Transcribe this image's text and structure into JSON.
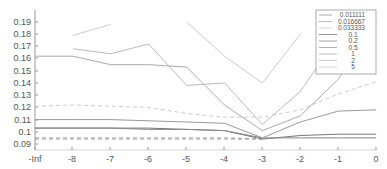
{
  "chart_data": {
    "type": "line",
    "title": "",
    "xlabel": "",
    "ylabel": "",
    "x_ticks": [
      "-Inf",
      "-8",
      "-7",
      "-6",
      "-5",
      "-4",
      "-3",
      "-2",
      "-1",
      "0"
    ],
    "x": [
      -9,
      -8,
      -7,
      -6,
      -5,
      -4,
      -3,
      -2,
      -1,
      0
    ],
    "y_ticks": [
      "0.09",
      "0.1",
      "0.11",
      "0.12",
      "0.13",
      "0.14",
      "0.15",
      "0.16",
      "0.17",
      "0.18",
      "0.19"
    ],
    "ylim": [
      0.088,
      0.199
    ],
    "xlim": [
      -9,
      0
    ],
    "grid": false,
    "legend_position": "upper right",
    "legend_title": "",
    "series": [
      {
        "name": "0.011111",
        "style": "dashed",
        "color": "#999999",
        "values": [
          0.095,
          0.095,
          0.095,
          0.095,
          0.095,
          0.095,
          0.094,
          null,
          null,
          null
        ]
      },
      {
        "name": "0.016667",
        "style": "dashed",
        "color": "#aaaaaa",
        "values": [
          0.094,
          0.094,
          0.094,
          0.094,
          0.094,
          0.094,
          0.094,
          null,
          null,
          null
        ]
      },
      {
        "name": "0.033333",
        "style": "dashed",
        "color": "#cccccc",
        "values": [
          0.121,
          0.122,
          0.121,
          0.12,
          0.115,
          0.112,
          0.112,
          0.118,
          0.131,
          0.141
        ]
      },
      {
        "name": "0.1",
        "style": "solid",
        "color": "#777777",
        "values": [
          0.103,
          0.103,
          0.103,
          0.103,
          0.102,
          0.101,
          0.094,
          0.097,
          0.098,
          0.098
        ]
      },
      {
        "name": "0.2",
        "style": "solid",
        "color": "#888888",
        "values": [
          0.103,
          0.103,
          0.103,
          0.102,
          0.102,
          0.101,
          0.095,
          0.095,
          0.095,
          0.095
        ]
      },
      {
        "name": "0.5",
        "style": "solid",
        "color": "#999999",
        "values": [
          0.11,
          0.11,
          0.11,
          0.109,
          0.108,
          0.107,
          0.095,
          0.108,
          0.117,
          0.118
        ]
      },
      {
        "name": "1",
        "style": "solid",
        "color": "#aaaaaa",
        "values": [
          0.162,
          0.162,
          0.155,
          0.155,
          0.153,
          0.122,
          0.101,
          0.113,
          0.143,
          0.19
        ]
      },
      {
        "name": "2",
        "style": "solid",
        "color": "#bbbbbb",
        "values": [
          null,
          0.168,
          0.164,
          0.172,
          0.138,
          0.14,
          0.106,
          0.133,
          0.178,
          null
        ]
      },
      {
        "name": "5",
        "style": "solid",
        "color": "#cccccc",
        "values": [
          null,
          0.179,
          0.188,
          null,
          0.19,
          0.162,
          0.14,
          0.18,
          null,
          null
        ]
      }
    ]
  },
  "legend": {
    "items": [
      {
        "label": "0.011111"
      },
      {
        "label": "0.016667"
      },
      {
        "label": "0.033333"
      },
      {
        "label": "0.1"
      },
      {
        "label": "0.2"
      },
      {
        "label": "0.5"
      },
      {
        "label": "1"
      },
      {
        "label": "2"
      },
      {
        "label": "5"
      }
    ]
  },
  "axes": {
    "x_tick_labels": [
      "-Inf",
      "-8",
      "-7",
      "-6",
      "-5",
      "-4",
      "-3",
      "-2",
      "-1",
      "0"
    ],
    "y_tick_labels": [
      "0.19",
      "0.18",
      "0.17",
      "0.16",
      "0.15",
      "0.14",
      "0.13",
      "0.12",
      "0.11",
      "0.1",
      "0.09"
    ]
  }
}
